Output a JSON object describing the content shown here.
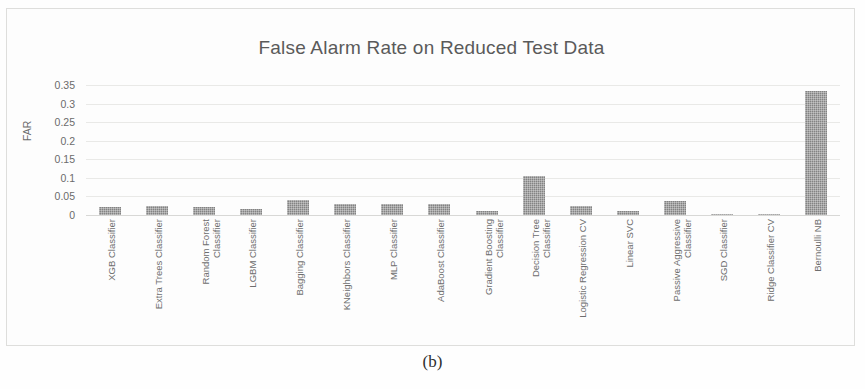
{
  "figure": {
    "caption": "(b)"
  },
  "chart_data": {
    "type": "bar",
    "title": "False Alarm Rate on Reduced Test Data",
    "xlabel": "",
    "ylabel": "FAR",
    "ylim": [
      0,
      0.35
    ],
    "yticks": [
      "0.35",
      "0.3",
      "0.25",
      "0.2",
      "0.15",
      "0.1",
      "0.05",
      "0"
    ],
    "ytick_values": [
      0.35,
      0.3,
      0.25,
      0.2,
      0.15,
      0.1,
      0.05,
      0
    ],
    "grid": true,
    "legend": "none",
    "bar_color": "#838383",
    "categories": [
      "XGB Classifier",
      "Extra Trees Classifier",
      "Random Forest Classifier",
      "LGBM Classifier",
      "Bagging Classifier",
      "KNeighbors Classifier",
      "MLP Classifier",
      "AdaBoost Classifier",
      "Gradient Boosting Classifier",
      "Decision Tree Classifier",
      "Logistic Regression CV",
      "Linear SVC",
      "Passive Aggressive Classifier",
      "SGD Classifier",
      "Ridge Classifier CV",
      "Bernoulli NB"
    ],
    "category_lines": [
      [
        "XGB Classifier"
      ],
      [
        "Extra Trees Classifier"
      ],
      [
        "Random Forest",
        "Classifier"
      ],
      [
        "LGBM Classifier"
      ],
      [
        "Bagging Classifier"
      ],
      [
        "KNeighbors Classifier"
      ],
      [
        "MLP Classifier"
      ],
      [
        "AdaBoost Classifier"
      ],
      [
        "Gradient Boosting",
        "Classifier"
      ],
      [
        "Decision Tree",
        "Classifier"
      ],
      [
        "Logistic Regression CV"
      ],
      [
        "Linear SVC"
      ],
      [
        "Passive Aggressive",
        "Classifier"
      ],
      [
        "SGD Classifier"
      ],
      [
        "Ridge Classifier CV"
      ],
      [
        "Bernoulli NB"
      ]
    ],
    "values": [
      0.022,
      0.024,
      0.022,
      0.015,
      0.041,
      0.029,
      0.029,
      0.03,
      0.012,
      0.105,
      0.024,
      0.012,
      0.037,
      0.004,
      0.003,
      0.335
    ]
  }
}
